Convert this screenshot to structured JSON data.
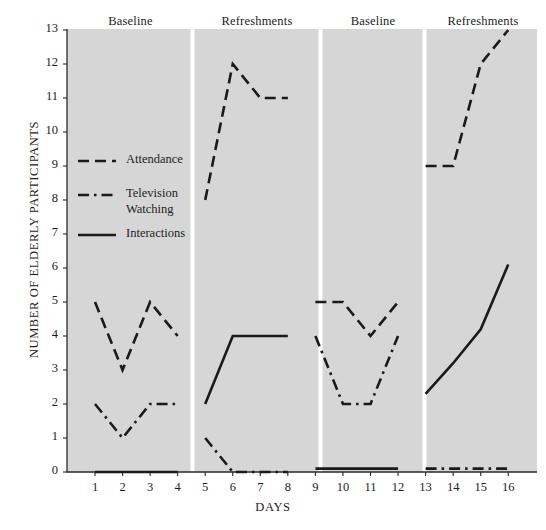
{
  "chart_data": {
    "type": "line",
    "title": "",
    "xlabel": "DAYS",
    "ylabel": "NUMBER OF ELDERLY PARTICIPANTS",
    "xlim": [
      0.4,
      16.6
    ],
    "ylim": [
      0,
      13
    ],
    "grid": false,
    "legend_position": "inside-left",
    "x": [
      1,
      2,
      3,
      4,
      5,
      6,
      7,
      8,
      9,
      10,
      11,
      12,
      13,
      14,
      15,
      16
    ],
    "yticks": [
      0,
      1,
      2,
      3,
      4,
      5,
      6,
      7,
      8,
      9,
      10,
      11,
      12,
      13
    ],
    "xticks": [
      1,
      2,
      3,
      4,
      5,
      6,
      7,
      8,
      9,
      10,
      11,
      12,
      13,
      14,
      15,
      16
    ],
    "phases": [
      {
        "label": "Baseline",
        "days": [
          1,
          2,
          3,
          4
        ]
      },
      {
        "label": "Refreshments",
        "days": [
          5,
          6,
          7,
          8
        ]
      },
      {
        "label": "Baseline",
        "days": [
          9,
          10,
          11,
          12
        ]
      },
      {
        "label": "Refreshments",
        "days": [
          13,
          14,
          15,
          16
        ]
      }
    ],
    "series": [
      {
        "name": "Attendance",
        "style": "dashed",
        "segments": [
          {
            "days": [
              1,
              2,
              3,
              4
            ],
            "values": [
              5,
              3,
              5,
              4
            ]
          },
          {
            "days": [
              5,
              6,
              7,
              8
            ],
            "values": [
              8,
              12,
              11,
              11
            ]
          },
          {
            "days": [
              9,
              10,
              11,
              12
            ],
            "values": [
              5,
              5,
              4,
              5
            ]
          },
          {
            "days": [
              13,
              14,
              15,
              16
            ],
            "values": [
              9,
              9,
              12,
              13
            ]
          }
        ]
      },
      {
        "name": "Television Watching",
        "style": "dash-dot",
        "segments": [
          {
            "days": [
              1,
              2,
              3,
              4
            ],
            "values": [
              2,
              1,
              2,
              2
            ]
          },
          {
            "days": [
              5,
              6,
              7,
              8
            ],
            "values": [
              1,
              0,
              0,
              0
            ]
          },
          {
            "days": [
              9,
              10,
              11,
              12
            ],
            "values": [
              4,
              2,
              2,
              4
            ]
          },
          {
            "days": [
              13,
              14,
              15,
              16
            ],
            "values": [
              0.1,
              0.1,
              0.1,
              0.1
            ]
          }
        ]
      },
      {
        "name": "Interactions",
        "style": "solid",
        "segments": [
          {
            "days": [
              1,
              2,
              3,
              4
            ],
            "values": [
              0,
              0,
              0,
              0
            ]
          },
          {
            "days": [
              5,
              6,
              7,
              8
            ],
            "values": [
              2,
              4,
              4,
              4
            ]
          },
          {
            "days": [
              9,
              10,
              11,
              12
            ],
            "values": [
              0.1,
              0.1,
              0.1,
              0.1
            ]
          },
          {
            "days": [
              13,
              14,
              15,
              16
            ],
            "values": [
              2.3,
              3.2,
              4.2,
              6.1
            ]
          }
        ]
      }
    ],
    "legend": [
      {
        "label": "Attendance",
        "style": "dashed"
      },
      {
        "label": "Television Watching",
        "style": "dash-dot"
      },
      {
        "label": "Interactions",
        "style": "solid"
      }
    ],
    "colors": {
      "line": "#1a1a1a",
      "plot_background": "#d6d6d6",
      "axis": "#2a2a2a",
      "page_background": "#ffffff"
    }
  }
}
